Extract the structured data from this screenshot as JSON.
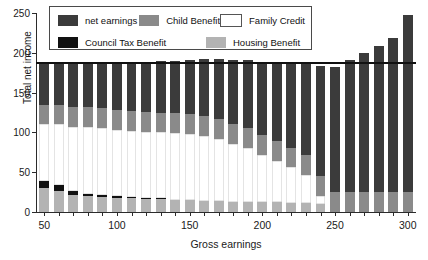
{
  "chart_data": {
    "type": "bar",
    "stacked": true,
    "title": "",
    "xlabel": "Gross earnings",
    "ylabel": "Total net income",
    "xlim": [
      45,
      305
    ],
    "ylim": [
      0,
      250
    ],
    "yticks": [
      0,
      50,
      100,
      150,
      200,
      250
    ],
    "xticks": [
      50,
      100,
      150,
      200,
      250,
      300
    ],
    "grid": false,
    "legend_position": "top-left",
    "categories": [
      50,
      60,
      70,
      80,
      90,
      100,
      110,
      120,
      130,
      140,
      150,
      160,
      170,
      180,
      190,
      200,
      210,
      220,
      230,
      240,
      250,
      260,
      270,
      280,
      290,
      300
    ],
    "reference_line": {
      "value": 188,
      "orientation": "horizontal",
      "color": "#111111"
    },
    "stack_order_bottom_to_top": [
      "Housing Benefit",
      "Council Tax Benefit",
      "Family Credit",
      "Child Benefit",
      "net earnings"
    ],
    "series": [
      {
        "name": "Housing Benefit",
        "color": "#b3b3b3",
        "values": [
          30,
          26,
          22,
          20,
          19,
          18,
          17,
          16,
          16,
          15,
          15,
          14,
          14,
          13,
          13,
          12,
          12,
          11,
          11,
          10,
          0,
          0,
          0,
          0,
          0,
          0
        ]
      },
      {
        "name": "Council Tax Benefit",
        "color": "#111111",
        "values": [
          9,
          8,
          5,
          3,
          3,
          2,
          2,
          1,
          1,
          0,
          0,
          0,
          0,
          0,
          0,
          0,
          0,
          0,
          0,
          0,
          0,
          0,
          0,
          0,
          0,
          0
        ]
      },
      {
        "name": "Family Credit",
        "color": "#ffffff",
        "values": [
          71,
          76,
          80,
          84,
          84,
          83,
          83,
          84,
          83,
          84,
          83,
          82,
          78,
          73,
          67,
          60,
          52,
          45,
          36,
          10,
          0,
          0,
          0,
          0,
          0,
          0
        ]
      },
      {
        "name": "Child Benefit",
        "color": "#8a8a8a",
        "values": [
          25,
          25,
          25,
          25,
          25,
          25,
          25,
          25,
          25,
          25,
          25,
          25,
          25,
          25,
          25,
          25,
          25,
          25,
          25,
          25,
          25,
          25,
          25,
          25,
          25,
          25
        ]
      },
      {
        "name": "net earnings",
        "color": "#3b3b3b",
        "values": [
          53,
          53,
          56,
          56,
          57,
          60,
          62,
          63,
          65,
          66,
          68,
          71,
          75,
          80,
          86,
          92,
          99,
          106,
          114,
          139,
          157,
          166,
          175,
          184,
          193,
          222
        ]
      }
    ],
    "totals": [
      188,
      188,
      188,
      188,
      188,
      188,
      189,
      189,
      190,
      190,
      191,
      192,
      192,
      191,
      191,
      189,
      188,
      187,
      186,
      184,
      182,
      191,
      200,
      209,
      218,
      247
    ]
  },
  "legend": {
    "items": [
      {
        "label": "net earnings",
        "color": "#3b3b3b",
        "outline": false
      },
      {
        "label": "Child Benefit",
        "color": "#8a8a8a",
        "outline": false
      },
      {
        "label": "Family Credit",
        "color": "#ffffff",
        "outline": true
      },
      {
        "label": "Council Tax Benefit",
        "color": "#111111",
        "outline": false
      },
      {
        "label": "Housing Benefit",
        "color": "#b3b3b3",
        "outline": false
      }
    ]
  }
}
